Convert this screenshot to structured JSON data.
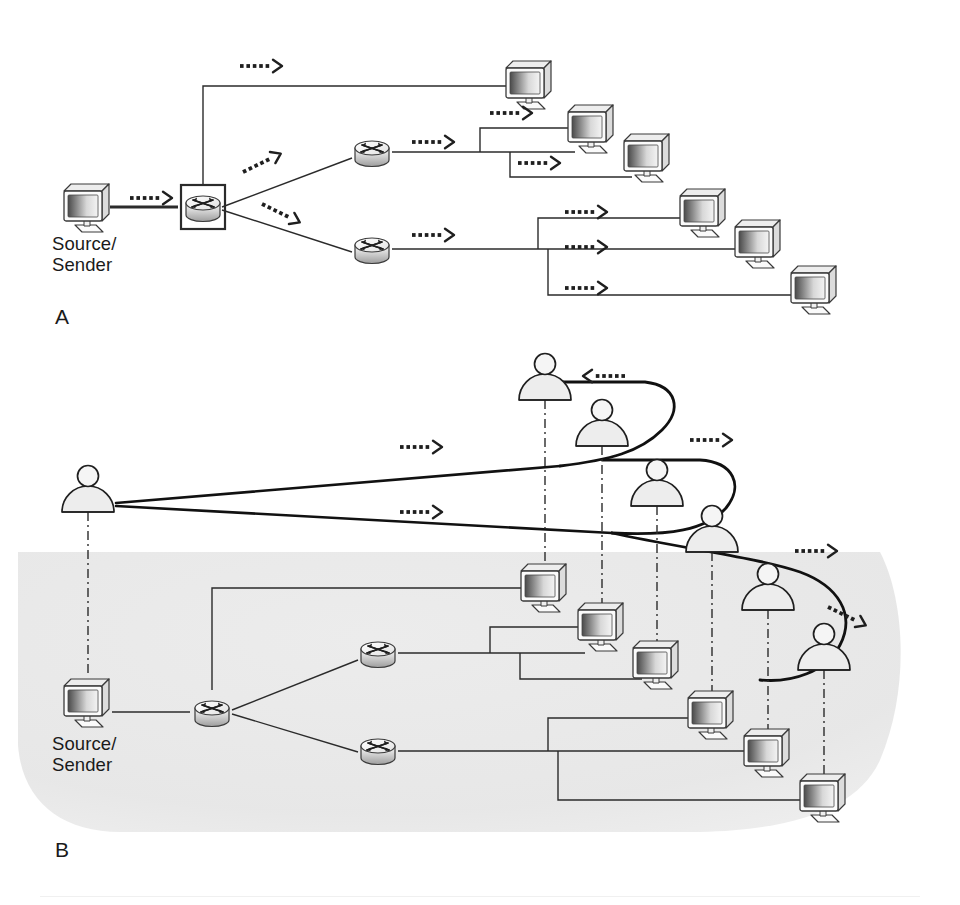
{
  "figure": {
    "background_color": "#ffffff",
    "ink_color": "#231f20",
    "shade_color": "#e8e8e8",
    "icon_fill": "#f2f2f2"
  },
  "panels": [
    {
      "id": "A",
      "label": "A",
      "label_x": 55,
      "label_y": 305,
      "caption": "Unicast replication tree: source sends a separate copy to every receiver",
      "source_label_line1": "Source/",
      "source_label_line2": "Sender",
      "source_label_x": 52,
      "source_label_y": 233,
      "shaded": false,
      "nodes": {
        "source_computer": {
          "name": "source-computer",
          "x": 88,
          "y": 205
        },
        "ingress_router": {
          "name": "boxed-router",
          "x": 203,
          "y": 207,
          "boxed": true
        },
        "router_top": {
          "name": "router-upper",
          "x": 372,
          "y": 152,
          "boxed": false
        },
        "router_bottom": {
          "name": "router-lower",
          "x": 372,
          "y": 249,
          "boxed": false
        }
      },
      "receivers": [
        {
          "name": "receiver-a1",
          "x": 530,
          "y": 82
        },
        {
          "name": "receiver-a2",
          "x": 592,
          "y": 126
        },
        {
          "name": "receiver-a3",
          "x": 648,
          "y": 155
        },
        {
          "name": "receiver-a4",
          "x": 704,
          "y": 210
        },
        {
          "name": "receiver-a5",
          "x": 759,
          "y": 241
        },
        {
          "name": "receiver-a6",
          "x": 815,
          "y": 287
        }
      ],
      "flow_arrows": [
        {
          "name": "flow-arrow-source",
          "x": 130,
          "y": 198,
          "dir": "right"
        },
        {
          "name": "flow-arrow-top-branch",
          "x": 240,
          "y": 66,
          "dir": "right"
        },
        {
          "name": "flow-arrow-up-diagonal",
          "x": 243,
          "y": 172,
          "dir": "upright"
        },
        {
          "name": "flow-arrow-down-diagonal",
          "x": 262,
          "y": 204,
          "dir": "downright"
        },
        {
          "name": "flow-arrow-r1-out",
          "x": 412,
          "y": 142,
          "dir": "right"
        },
        {
          "name": "flow-arrow-r1-branch2",
          "x": 490,
          "y": 113,
          "dir": "right"
        },
        {
          "name": "flow-arrow-r1-branch3",
          "x": 518,
          "y": 163,
          "dir": "right"
        },
        {
          "name": "flow-arrow-r2-out",
          "x": 412,
          "y": 235,
          "dir": "right"
        },
        {
          "name": "flow-arrow-r2-branch1",
          "x": 565,
          "y": 212,
          "dir": "right"
        },
        {
          "name": "flow-arrow-r2-branch2",
          "x": 565,
          "y": 247,
          "dir": "right"
        },
        {
          "name": "flow-arrow-r2-branch3",
          "x": 565,
          "y": 288,
          "dir": "right"
        }
      ]
    },
    {
      "id": "B",
      "label": "B",
      "label_x": 55,
      "label_y": 838,
      "caption": "Multicast distribution: one stream replicated at branch points to many users",
      "source_label_line1": "Source/",
      "source_label_line2": "Sender",
      "source_label_x": 52,
      "source_label_y": 733,
      "shaded": true,
      "nodes": {
        "source_computer": {
          "name": "source-computer",
          "x": 88,
          "y": 700
        },
        "ingress_router": {
          "name": "router-ingress",
          "x": 212,
          "y": 712,
          "boxed": false
        },
        "router_top": {
          "name": "router-upper",
          "x": 378,
          "y": 653,
          "boxed": false
        },
        "router_bottom": {
          "name": "router-lower",
          "x": 378,
          "y": 750,
          "boxed": false
        }
      },
      "receivers": [
        {
          "name": "receiver-b1",
          "x": 545,
          "y": 585
        },
        {
          "name": "receiver-b2",
          "x": 602,
          "y": 624
        },
        {
          "name": "receiver-b3",
          "x": 657,
          "y": 662
        },
        {
          "name": "receiver-b4",
          "x": 712,
          "y": 712
        },
        {
          "name": "receiver-b5",
          "x": 768,
          "y": 750
        },
        {
          "name": "receiver-b6",
          "x": 824,
          "y": 795
        }
      ],
      "people": [
        {
          "name": "user-origin",
          "x": 88,
          "y": 490,
          "link_to": "source-computer"
        },
        {
          "name": "user-1",
          "x": 545,
          "y": 378,
          "link_to": "receiver-b1"
        },
        {
          "name": "user-2",
          "x": 602,
          "y": 424,
          "link_to": "receiver-b2"
        },
        {
          "name": "user-3",
          "x": 657,
          "y": 484,
          "link_to": "receiver-b3"
        },
        {
          "name": "user-4",
          "x": 712,
          "y": 530,
          "link_to": "receiver-b4"
        },
        {
          "name": "user-5",
          "x": 768,
          "y": 588,
          "link_to": "receiver-b5"
        },
        {
          "name": "user-6",
          "x": 824,
          "y": 648,
          "link_to": "receiver-b6"
        }
      ],
      "flow_arrows": [
        {
          "name": "flow-arrow-upper-fan",
          "x": 400,
          "y": 447,
          "dir": "right"
        },
        {
          "name": "flow-arrow-lower-fan",
          "x": 400,
          "y": 512,
          "dir": "right"
        },
        {
          "name": "flow-arrow-return-1",
          "x": 625,
          "y": 376,
          "dir": "left"
        },
        {
          "name": "flow-arrow-return-2",
          "x": 690,
          "y": 440,
          "dir": "right"
        },
        {
          "name": "flow-arrow-return-3",
          "x": 795,
          "y": 551,
          "dir": "right"
        },
        {
          "name": "flow-arrow-return-4",
          "x": 828,
          "y": 607,
          "dir": "downright"
        }
      ]
    }
  ],
  "legend": {
    "arrow_meaning": "direction of data flow",
    "solid_line_meaning": "network link",
    "dashdot_line_meaning": "association between user and workstation",
    "shaded_region_meaning": "multicast-enabled network domain"
  }
}
